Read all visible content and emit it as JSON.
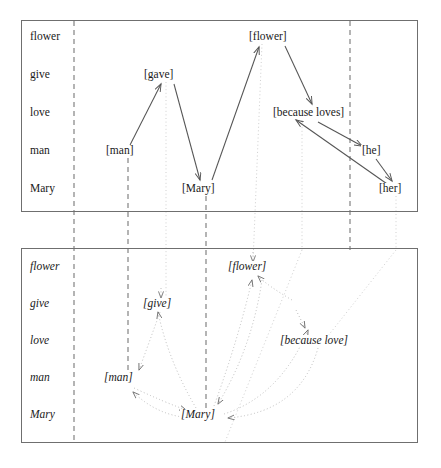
{
  "figure": {
    "type": "linguistic-derivation-diagram",
    "panels": [
      {
        "id": "surface-structure",
        "style": "upright-serif",
        "row_labels": [
          "flower",
          "give",
          "love",
          "man",
          "Mary"
        ],
        "nodes": [
          {
            "id": "flower",
            "label": "[flower]",
            "row": "flower",
            "x": 276,
            "y": 37
          },
          {
            "id": "gave",
            "label": "[gave]",
            "row": "give",
            "x": 166,
            "y": 75
          },
          {
            "id": "because_loves",
            "label": "[because loves]",
            "row": "love",
            "x": 322,
            "y": 113
          },
          {
            "id": "man",
            "label": "[man]",
            "row": "man",
            "x": 124,
            "y": 151
          },
          {
            "id": "he",
            "label": "[he]",
            "row": "man",
            "x": 373,
            "y": 151
          },
          {
            "id": "mary",
            "label": "[Mary]",
            "row": "Mary",
            "x": 205,
            "y": 189
          },
          {
            "id": "her",
            "label": "[her]",
            "row": "Mary",
            "x": 396,
            "y": 189
          }
        ],
        "arrows": [
          {
            "from": "man",
            "to": "gave",
            "kind": "solid"
          },
          {
            "from": "gave",
            "to": "mary",
            "kind": "solid"
          },
          {
            "from": "mary",
            "to": "flower",
            "kind": "solid"
          },
          {
            "from": "flower",
            "to": "because_loves",
            "kind": "solid"
          },
          {
            "from": "because_loves",
            "to": "he",
            "kind": "solid"
          },
          {
            "from": "he",
            "to": "her",
            "kind": "solid"
          },
          {
            "from": "her",
            "to": "because_loves",
            "kind": "solid"
          }
        ]
      },
      {
        "id": "deep-structure",
        "style": "italic-serif",
        "row_labels": [
          "flower",
          "give",
          "love",
          "man",
          "Mary"
        ],
        "nodes": [
          {
            "id": "flower",
            "label": "[flower]",
            "row": "flower",
            "x": 253,
            "y": 267
          },
          {
            "id": "give",
            "label": "[give]",
            "row": "give",
            "x": 161,
            "y": 304
          },
          {
            "id": "because_love",
            "label": "[because love]",
            "row": "love",
            "x": 320,
            "y": 341
          },
          {
            "id": "man",
            "label": "[man]",
            "row": "man",
            "x": 124,
            "y": 378
          },
          {
            "id": "mary",
            "label": "[Mary]",
            "row": "Mary",
            "x": 205,
            "y": 415
          }
        ],
        "arrows": [
          {
            "from": "give",
            "to": "man",
            "kind": "dotted-curve"
          },
          {
            "from": "man",
            "to": "give",
            "kind": "dotted-curve"
          },
          {
            "from": "give",
            "to": "mary",
            "kind": "dotted-curve"
          },
          {
            "from": "mary",
            "to": "man",
            "kind": "dotted-curve"
          },
          {
            "from": "mary",
            "to": "flower",
            "kind": "dotted-curve"
          },
          {
            "from": "flower",
            "to": "mary",
            "kind": "dotted-curve"
          },
          {
            "from": "mary",
            "to": "because_love",
            "kind": "dotted-curve"
          },
          {
            "from": "because_love",
            "to": "mary",
            "kind": "dotted-curve"
          }
        ]
      }
    ],
    "vertical_dashed_lines_x": [
      74,
      128,
      206,
      350
    ],
    "vertical_dotted_lines_x": [
      166,
      253,
      302,
      396
    ],
    "colors": {
      "panel_border": "#6f6f6f",
      "text": "#1a1a1a",
      "solid_arrow": "#555555",
      "dotted_arrow": "#b9b9b9",
      "dashed_guide": "#777777",
      "dotted_guide": "#cccccc",
      "background": "#ffffff"
    }
  }
}
